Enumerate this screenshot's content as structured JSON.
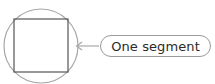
{
  "diagram": {
    "title": "",
    "elements": {
      "circle": {
        "cx": 41,
        "cy": 46,
        "r": 37,
        "stroke": "#a8a8a8"
      },
      "square": {
        "x": 14,
        "y": 19,
        "width": 54,
        "height": 53,
        "stroke": "#555555"
      },
      "arrow": {
        "x1": 99,
        "y1": 46,
        "x2": 76,
        "y2": 46,
        "stroke": "#a8a8a8",
        "direction": "left"
      }
    },
    "callout": {
      "label": "One segment",
      "border_color": "#9a9a9a"
    }
  }
}
